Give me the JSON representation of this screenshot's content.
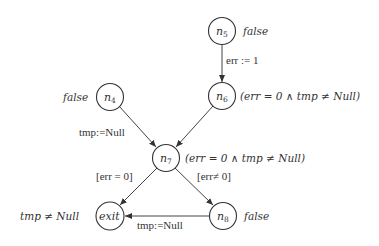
{
  "nodes": [
    {
      "id": "n5",
      "base": "n",
      "sub": "5",
      "annotation": "false"
    },
    {
      "id": "n6",
      "base": "n",
      "sub": "6",
      "annotation": "(err = 0 ∧  tmp ≠ Null)"
    },
    {
      "id": "n4",
      "base": "n",
      "sub": "4",
      "annotation": "false"
    },
    {
      "id": "n7",
      "base": "n",
      "sub": "7",
      "annotation": "(err = 0 ∧ tmp ≠ Null)"
    },
    {
      "id": "exit",
      "base": "exit",
      "sub": "",
      "annotation": "tmp ≠ Null"
    },
    {
      "id": "n8",
      "base": "n",
      "sub": "8",
      "annotation": "false"
    }
  ],
  "edges": [
    {
      "from": "n5",
      "to": "n6",
      "label": "err := 1"
    },
    {
      "from": "n4",
      "to": "n7",
      "label": "tmp:=Null"
    },
    {
      "from": "n6",
      "to": "n7",
      "label": ""
    },
    {
      "from": "n7",
      "to": "exit",
      "label": "[err = 0]"
    },
    {
      "from": "n7",
      "to": "n8",
      "label": "[err≠ 0]"
    },
    {
      "from": "n8",
      "to": "exit",
      "label": "tmp:=Null"
    }
  ]
}
